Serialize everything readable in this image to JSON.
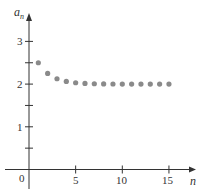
{
  "chart_data": {
    "type": "scatter",
    "title": "",
    "xlabel": "n",
    "ylabel": "a_n",
    "x": [
      1,
      2,
      3,
      4,
      5,
      6,
      7,
      8,
      9,
      10,
      11,
      12,
      13,
      14,
      15
    ],
    "values": [
      2.5,
      2.25,
      2.125,
      2.0625,
      2.03125,
      2.015625,
      2.0078,
      2.0039,
      2.002,
      2.001,
      2.0005,
      2.0002,
      2.0001,
      2.0001,
      2.0
    ],
    "xlim": [
      -3,
      18
    ],
    "ylim": [
      -0.5,
      3.7
    ],
    "x_ticks": [
      5,
      10,
      15
    ],
    "x_tick_labels": [
      "5",
      "10",
      "15"
    ],
    "y_ticks": [
      0.5,
      1,
      1.5,
      2,
      2.5,
      3
    ],
    "y_tick_labels": [
      "",
      "1",
      "",
      "2",
      "",
      "3"
    ],
    "origin_label": "0",
    "grid": false,
    "legend": null,
    "marker_color": "#8a8a8a",
    "axis_color": "#333333"
  },
  "labels": {
    "x_axis": "n",
    "y_axis_base": "a",
    "y_axis_sub": "n",
    "origin": "0",
    "x_ticks": [
      "5",
      "10",
      "15"
    ],
    "y_ticks": [
      "1",
      "2",
      "3"
    ]
  }
}
